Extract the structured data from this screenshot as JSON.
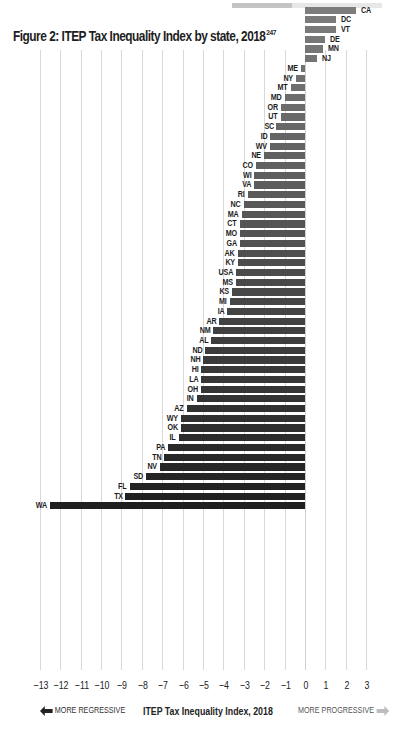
{
  "title": "Figure 2: ITEP Tax Inequality Index by state, 2018",
  "title_footnote": "247",
  "footer": {
    "left_label": "MORE REGRESSIVE",
    "center_label": "ITEP Tax Inequality Index, 2018",
    "right_label": "MORE PROGRESSIVE",
    "left_arrow_color": "#222222",
    "right_arrow_color": "#bdbdbd"
  },
  "colors": {
    "bar_top": "#7d7d7d",
    "bar_bottom": "#1f1f1f",
    "grid": "#d8d8d8"
  },
  "chart_data": {
    "type": "bar",
    "orientation": "horizontal",
    "title": "Figure 2: ITEP Tax Inequality Index by state, 2018",
    "xlabel": "ITEP Tax Inequality Index, 2018",
    "ylabel": "",
    "xlim": [
      -13,
      3
    ],
    "xticks": [
      -13,
      -12,
      -11,
      -10,
      -9,
      -8,
      -7,
      -6,
      -5,
      -4,
      -3,
      -2,
      -1,
      0,
      1,
      2,
      3
    ],
    "grid": true,
    "annotations": [
      "MORE REGRESSIVE",
      "MORE PROGRESSIVE"
    ],
    "categories": [
      "CA",
      "DC",
      "VT",
      "DE",
      "MN",
      "NJ",
      "ME",
      "NY",
      "MT",
      "MD",
      "OR",
      "UT",
      "SC",
      "ID",
      "WV",
      "NE",
      "CO",
      "WI",
      "VA",
      "RI",
      "NC",
      "MA",
      "CT",
      "MO",
      "GA",
      "AK",
      "KY",
      "USA",
      "MS",
      "KS",
      "MI",
      "IA",
      "AR",
      "NM",
      "AL",
      "ND",
      "NH",
      "HI",
      "LA",
      "OH",
      "IN",
      "AZ",
      "WY",
      "OK",
      "IL",
      "PA",
      "TN",
      "NV",
      "SD",
      "FL",
      "TX",
      "WA"
    ],
    "values": [
      2.5,
      1.5,
      1.5,
      1.0,
      0.9,
      0.6,
      -0.2,
      -0.45,
      -0.7,
      -1.0,
      -1.2,
      -1.2,
      -1.4,
      -1.7,
      -1.7,
      -2.0,
      -2.4,
      -2.5,
      -2.5,
      -2.8,
      -3.0,
      -3.1,
      -3.2,
      -3.2,
      -3.2,
      -3.3,
      -3.3,
      -3.4,
      -3.4,
      -3.6,
      -3.7,
      -3.8,
      -4.2,
      -4.5,
      -4.6,
      -4.9,
      -5.0,
      -5.1,
      -5.1,
      -5.1,
      -5.3,
      -5.8,
      -6.1,
      -6.1,
      -6.2,
      -6.7,
      -6.9,
      -7.1,
      -7.8,
      -8.6,
      -8.8,
      -12.5
    ]
  }
}
